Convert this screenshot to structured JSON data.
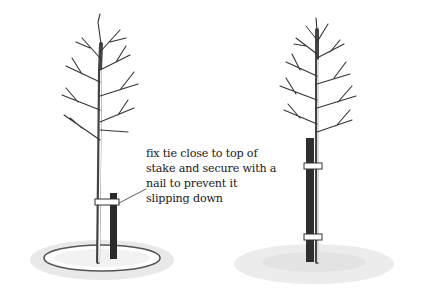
{
  "figure": {
    "panels": [
      {
        "id": "left",
        "description": "young tree with short stake tied near top of stake, mulch circle at base",
        "annotation": {
          "lines": [
            "fix tie close to top of",
            "stake and secure with a",
            "nail to prevent it",
            "slipping down"
          ]
        }
      },
      {
        "id": "right",
        "description": "young tree with tall stake and two ties, grass at base"
      }
    ],
    "colors": {
      "ink": "#1a1a1a",
      "background": "#ffffff"
    }
  }
}
